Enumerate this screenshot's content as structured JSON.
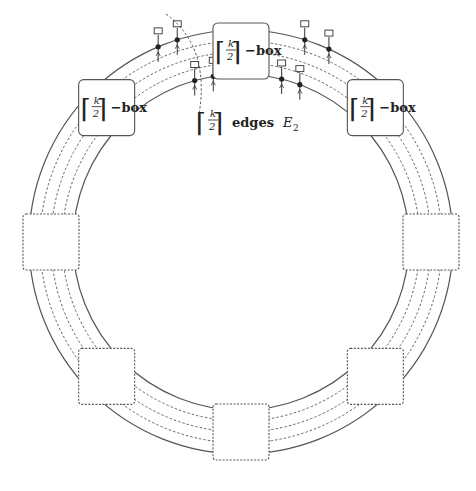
{
  "diagram": {
    "type": "ring-of-boxes",
    "ring": {
      "center": [
        241,
        242
      ],
      "outer_radius": 212,
      "inner_radius": 168,
      "dashed_tracks": 3
    },
    "colors": {
      "line": "#555555",
      "dashed": "#555555",
      "text": "#222222",
      "background": "#ffffff"
    },
    "boxes": [
      {
        "id": "top",
        "angle": -90,
        "style": "solid",
        "label_frac_num": "k",
        "label_frac_den": "2",
        "label_suffix": "−box"
      },
      {
        "id": "upper-left",
        "angle": -135,
        "style": "solid",
        "label_frac_num": "k",
        "label_frac_den": "2",
        "label_suffix": "−box"
      },
      {
        "id": "upper-right",
        "angle": -45,
        "style": "solid",
        "label_frac_num": "k",
        "label_frac_den": "2",
        "label_suffix": "−box"
      },
      {
        "id": "left",
        "angle": 180,
        "style": "dashed"
      },
      {
        "id": "right",
        "angle": 0,
        "style": "dashed"
      },
      {
        "id": "lower-left",
        "angle": 135,
        "style": "dashed"
      },
      {
        "id": "lower-right",
        "angle": 45,
        "style": "dashed"
      },
      {
        "id": "bottom",
        "angle": 90,
        "style": "dashed"
      }
    ],
    "annotation": {
      "frac_num": "k",
      "frac_den": "2",
      "text": "edges",
      "symbol": "E",
      "subscript": "2"
    }
  }
}
